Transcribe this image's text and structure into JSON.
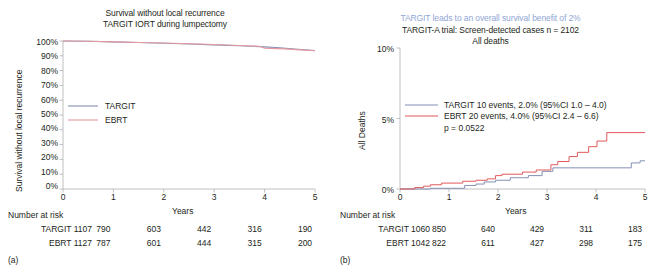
{
  "chart_data": [
    {
      "type": "line",
      "panel": "a",
      "panel_tag": "(a)",
      "title": "Survival without local recurrence",
      "subtitle": "TARGIT IORT during lumpectomy",
      "xlabel": "Years",
      "ylabel": "Survival without local recurrence",
      "xlim": [
        0,
        5
      ],
      "ylim": [
        0,
        100
      ],
      "xticks": [
        "0",
        "1",
        "2",
        "3",
        "4",
        "5"
      ],
      "yticks": [
        "100%",
        "90%",
        "80%",
        "70%",
        "60%",
        "50%",
        "40%",
        "30%",
        "20%",
        "10%",
        "0%"
      ],
      "grid": false,
      "legend_position": "left-middle",
      "series": [
        {
          "name": "TARGIT",
          "color": "#8490b5",
          "x": [
            0,
            0.5,
            1.0,
            1.5,
            2.0,
            2.5,
            3.0,
            3.5,
            4.0,
            4.3,
            4.6,
            5.0
          ],
          "values": [
            100,
            99.8,
            99.4,
            99.0,
            98.5,
            98.0,
            97.4,
            96.8,
            96.0,
            95.4,
            94.6,
            93.6
          ]
        },
        {
          "name": "EBRT",
          "color": "#e49a9e",
          "x": [
            0,
            0.5,
            1.0,
            1.5,
            2.0,
            2.5,
            3.0,
            3.5,
            3.9,
            4.0,
            4.4,
            4.7,
            5.0
          ],
          "values": [
            100,
            99.8,
            99.4,
            99.0,
            98.6,
            98.1,
            97.6,
            97.0,
            96.4,
            95.2,
            94.7,
            94.0,
            93.4
          ]
        }
      ],
      "risk_table": {
        "title": "Number at risk",
        "rows": [
          {
            "label": "TARGIT 1107",
            "values": [
              "790",
              "603",
              "442",
              "316",
              "190"
            ]
          },
          {
            "label": "EBRT 1127",
            "values": [
              "787",
              "601",
              "444",
              "315",
              "200"
            ]
          }
        ]
      }
    },
    {
      "type": "line",
      "panel": "b",
      "panel_tag": "(b)",
      "headline": "TARGIT leads to an overall survival benefit of 2%",
      "headline_color": "#8fa6d4",
      "title": "TARGIT-A trial: Screen-detected cases n = 2102",
      "subtitle": "All deaths",
      "xlabel": "Years",
      "ylabel": "All Deaths",
      "xlim": [
        0,
        5
      ],
      "ylim": [
        0,
        10
      ],
      "xticks": [
        "0",
        "1",
        "2",
        "3",
        "4",
        "5"
      ],
      "yticks": [
        "10%",
        "5%",
        "0%"
      ],
      "grid": false,
      "legend_position": "left-upper",
      "annotation_pvalue": "p = 0.0522",
      "series": [
        {
          "name": "TARGIT 10 events, 2.0% (95%CI 1.0 – 4.0)",
          "short_name": "TARGIT",
          "color": "#8490b5",
          "step": true,
          "x": [
            0,
            0.62,
            0.62,
            1.32,
            1.32,
            1.55,
            1.55,
            1.72,
            1.72,
            1.95,
            1.95,
            2.25,
            2.25,
            2.62,
            2.62,
            2.9,
            2.9,
            3.12,
            3.12,
            4.72,
            4.72,
            4.9,
            4.9,
            5.0
          ],
          "values": [
            0,
            0,
            0.05,
            0.05,
            0.25,
            0.25,
            0.35,
            0.35,
            0.5,
            0.5,
            0.62,
            0.62,
            0.8,
            0.8,
            0.95,
            0.95,
            1.25,
            1.25,
            1.5,
            1.5,
            1.85,
            1.85,
            2.0,
            2.0
          ]
        },
        {
          "name": "EBRT 20 events, 4.0% (95%CI 2.4 – 6.6)",
          "short_name": "EBRT",
          "color": "#e2595c",
          "step": true,
          "x": [
            0,
            0.3,
            0.3,
            0.48,
            0.48,
            0.62,
            0.62,
            0.85,
            0.85,
            1.28,
            1.28,
            1.55,
            1.55,
            1.78,
            1.78,
            1.95,
            1.95,
            2.08,
            2.08,
            2.5,
            2.5,
            2.78,
            2.78,
            3.08,
            3.08,
            3.22,
            3.22,
            3.45,
            3.45,
            3.62,
            3.62,
            3.85,
            3.85,
            4.02,
            4.02,
            4.22,
            4.22,
            5.0
          ],
          "values": [
            0,
            0,
            0.1,
            0.1,
            0.2,
            0.2,
            0.3,
            0.3,
            0.42,
            0.42,
            0.55,
            0.55,
            0.62,
            0.62,
            0.72,
            0.72,
            0.95,
            0.95,
            1.05,
            1.05,
            1.2,
            1.2,
            1.35,
            1.35,
            1.72,
            1.72,
            1.95,
            1.95,
            2.3,
            2.3,
            2.6,
            2.6,
            3.0,
            3.0,
            3.4,
            3.4,
            4.0,
            4.0
          ]
        }
      ],
      "risk_table": {
        "title": "Number at risk",
        "rows": [
          {
            "label": "TARGIT 1060",
            "values": [
              "850",
              "640",
              "429",
              "311",
              "183"
            ]
          },
          {
            "label": "EBRT 1042",
            "values": [
              "822",
              "611",
              "427",
              "298",
              "175"
            ]
          }
        ]
      }
    }
  ]
}
